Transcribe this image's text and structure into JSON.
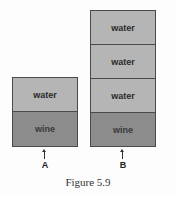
{
  "diagram": {
    "containers": [
      {
        "id": "A",
        "label": "A",
        "layers_top_to_bottom": [
          {
            "type": "water",
            "label": "water"
          },
          {
            "type": "wine",
            "label": "wine"
          }
        ]
      },
      {
        "id": "B",
        "label": "B",
        "layers_top_to_bottom": [
          {
            "type": "water",
            "label": "water"
          },
          {
            "type": "water",
            "label": "water"
          },
          {
            "type": "water",
            "label": "water"
          },
          {
            "type": "wine",
            "label": "wine"
          }
        ]
      }
    ],
    "caption": "Figure 5.9",
    "colors": {
      "water": "#b5b5b5",
      "wine": "#8c8c8c",
      "border": "#4a4a4a"
    }
  }
}
